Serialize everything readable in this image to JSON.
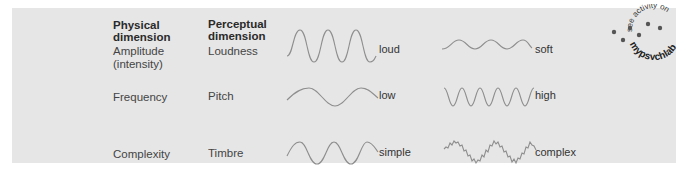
{
  "headers": {
    "physical": "Physical dimension",
    "physical_l1": "Physical",
    "physical_l2": "dimension",
    "perceptual_l1": "Perceptual",
    "perceptual_l2": "dimension"
  },
  "rows": [
    {
      "physical_l1": "Amplitude",
      "physical_l2": "(intensity)",
      "perceptual": "Loudness",
      "wave1": {
        "label": "loud",
        "type": "high-amplitude"
      },
      "wave2": {
        "label": "soft",
        "type": "low-amplitude"
      }
    },
    {
      "physical_l1": "Frequency",
      "physical_l2": "",
      "perceptual": "Pitch",
      "wave1": {
        "label": "low",
        "type": "low-frequency"
      },
      "wave2": {
        "label": "high",
        "type": "high-frequency"
      }
    },
    {
      "physical_l1": "Complexity",
      "physical_l2": "",
      "perceptual": "Timbre",
      "wave1": {
        "label": "simple",
        "type": "simple-sine"
      },
      "wave2": {
        "label": "complex",
        "type": "complex-noisy"
      }
    }
  ],
  "badge": {
    "arc_text": "see activity on",
    "brand": "mypsychlab"
  },
  "colors": {
    "panel": "#e6e6e6",
    "wave": "#8e8e8e",
    "text": "#444444"
  }
}
